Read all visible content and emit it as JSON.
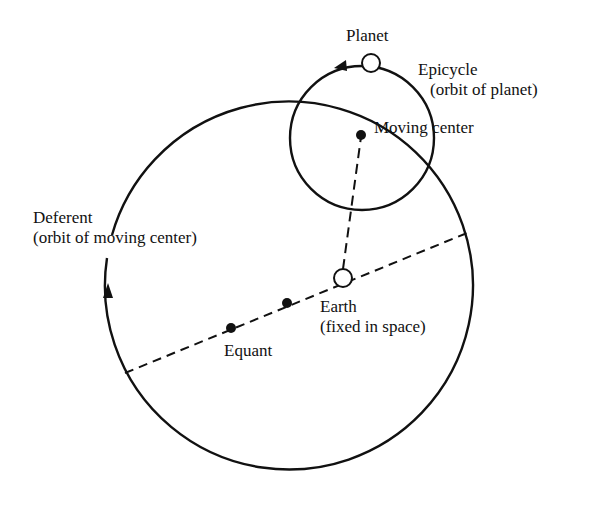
{
  "diagram": {
    "labels": {
      "planet": "Planet",
      "epicycle_line1": "Epicycle",
      "epicycle_line2": "(orbit of planet)",
      "moving_center": "Moving center",
      "deferent_line1": "Deferent",
      "deferent_line2": "(orbit of moving center)",
      "earth_line1": "Earth",
      "earth_line2": "(fixed in space)",
      "equant": "Equant"
    },
    "geometry": {
      "deferent": {
        "cx": 284,
        "cy": 301,
        "r": 184
      },
      "epicycle": {
        "cx": 362,
        "cy": 138,
        "r": 72
      },
      "planet": {
        "cx": 371,
        "cy": 63,
        "r": 9
      },
      "moving_center": {
        "cx": 361,
        "cy": 135
      },
      "earth": {
        "cx": 343,
        "cy": 278,
        "r": 9
      },
      "deferent_center_dot": {
        "cx": 287,
        "cy": 303
      },
      "equant_dot": {
        "cx": 231,
        "cy": 328
      }
    },
    "colors": {
      "ink": "#111111",
      "background": "#ffffff"
    }
  }
}
